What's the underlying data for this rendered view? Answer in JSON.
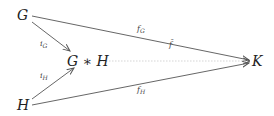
{
  "diagram": {
    "type": "commutative-diagram",
    "nodes": {
      "G": "G",
      "GH": "G ∗ H",
      "H": "H",
      "K": "K"
    },
    "arrows": [
      {
        "from": "G",
        "to": "G*H",
        "label_main": "i",
        "label_sub": "G",
        "style": "solid"
      },
      {
        "from": "H",
        "to": "G*H",
        "label_main": "i",
        "label_sub": "H",
        "style": "solid"
      },
      {
        "from": "G",
        "to": "K",
        "label_main": "f",
        "label_sub": "G",
        "style": "solid"
      },
      {
        "from": "H",
        "to": "K",
        "label_main": "f",
        "label_sub": "H",
        "style": "solid"
      },
      {
        "from": "G*H",
        "to": "K",
        "label_main": "f̄",
        "label_sub": "",
        "style": "dotted"
      }
    ],
    "labels": {
      "iG_main": "i",
      "iG_sub": "G",
      "iH_main": "i",
      "iH_sub": "H",
      "fG_main": "f",
      "fG_sub": "G",
      "fH_main": "f",
      "fH_sub": "H",
      "fbar": "f̄"
    },
    "colors": {
      "arrow": "#555555",
      "dotted_arrow": "#d0d0d0",
      "text": "#222222"
    }
  }
}
